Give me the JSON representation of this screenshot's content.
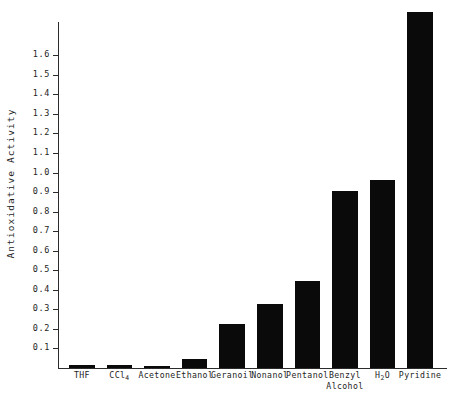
{
  "chart_data": {
    "type": "bar",
    "title": "",
    "xlabel": "",
    "ylabel": "Antioxidative Activity",
    "ylim": [
      0,
      1.77
    ],
    "ytick_values": [
      0.1,
      0.2,
      0.3,
      0.4,
      0.5,
      0.6,
      0.7,
      0.8,
      0.9,
      1.0,
      1.1,
      1.2,
      1.3,
      1.4,
      1.5,
      1.6
    ],
    "ytick_labels": [
      "0.1",
      "0.2",
      "0.3",
      "0.4",
      "0.5",
      "0.6",
      "0.7",
      "0.8",
      "0.9",
      "1.0",
      "1.1",
      "1.2",
      "1.3",
      "1.4",
      "1.5",
      "1.6"
    ],
    "grid": false,
    "legend": false,
    "bar_color": "#0a0a0a",
    "axis_color": "#2b2b2b",
    "background_color": "#ffffff",
    "categories": [
      "THF",
      "CCl4",
      "Acetone",
      "Ethanol",
      "Geranoil",
      "Nonanol",
      "Pentanol",
      "Benzyl Alcohol",
      "H2O",
      "Pyridine"
    ],
    "category_labels": [
      {
        "line1": "THF",
        "line2": "",
        "sub": ""
      },
      {
        "line1": "CCl",
        "line2": "",
        "sub": "4"
      },
      {
        "line1": "Acetone",
        "line2": "",
        "sub": ""
      },
      {
        "line1": "Ethanol",
        "line2": "",
        "sub": ""
      },
      {
        "line1": "Geranoil",
        "line2": "",
        "sub": ""
      },
      {
        "line1": "Nonanol",
        "line2": "",
        "sub": ""
      },
      {
        "line1": "Pentanol",
        "line2": "",
        "sub": ""
      },
      {
        "line1": "Benzyl",
        "line2": "Alcohol",
        "sub": ""
      },
      {
        "line1": "H",
        "line2": "",
        "sub": "2",
        "post": "O"
      },
      {
        "line1": "Pyridine",
        "line2": "",
        "sub": ""
      }
    ],
    "values": [
      0.015,
      0.013,
      0.007,
      0.045,
      0.225,
      0.33,
      0.445,
      0.905,
      0.96,
      1.82
    ]
  }
}
